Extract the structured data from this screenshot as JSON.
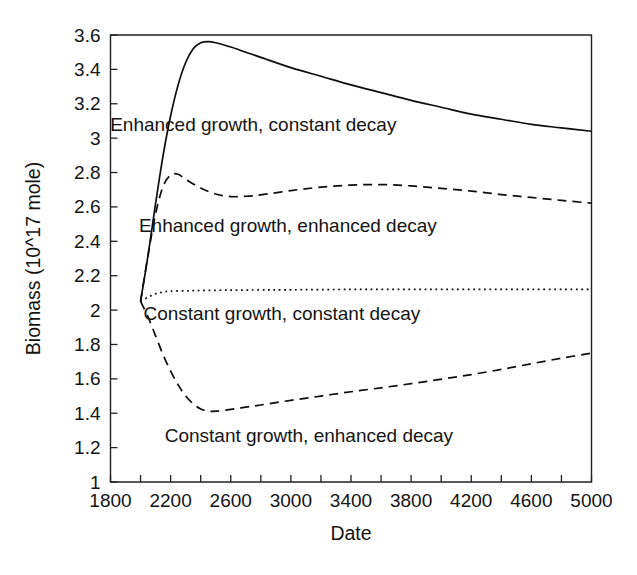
{
  "chart_data": {
    "type": "line",
    "title": "",
    "xlabel": "Date",
    "ylabel": "Biomass (10^17 mole)",
    "xlim": [
      1800,
      5000
    ],
    "ylim": [
      1,
      3.6
    ],
    "grid": false,
    "legend_position": "inline-annotations",
    "x_ticks_labeled": [
      1800,
      2200,
      2600,
      3000,
      3400,
      3800,
      4200,
      4600,
      5000
    ],
    "x_ticks_minor": [
      2000,
      2400,
      2800,
      3200,
      3600,
      4000,
      4400,
      4800
    ],
    "x_tick_labels": [
      "1800",
      "2200",
      "2600",
      "3000",
      "3400",
      "3800",
      "4200",
      "4600",
      "5000"
    ],
    "y_ticks": [
      1,
      1.2,
      1.4,
      1.6,
      1.8,
      2,
      2.2,
      2.4,
      2.6,
      2.8,
      3,
      3.2,
      3.4,
      3.6
    ],
    "y_tick_labels": [
      "1",
      "1.2",
      "1.4",
      "1.6",
      "1.8",
      "2",
      "2.2",
      "2.4",
      "2.6",
      "2.8",
      "3",
      "3.2",
      "3.4",
      "3.6"
    ],
    "series": [
      {
        "name": "Enhanced growth, constant decay",
        "style": "solid",
        "label_x": 2750,
        "label_y": 3.08,
        "x": [
          2000,
          2050,
          2100,
          2150,
          2200,
          2250,
          2300,
          2350,
          2400,
          2450,
          2500,
          2600,
          2700,
          2800,
          3000,
          3200,
          3400,
          3600,
          3800,
          4000,
          4200,
          4400,
          4600,
          4800,
          5000
        ],
        "y": [
          2.05,
          2.32,
          2.62,
          2.9,
          3.13,
          3.31,
          3.44,
          3.52,
          3.555,
          3.562,
          3.555,
          3.53,
          3.5,
          3.47,
          3.41,
          3.36,
          3.31,
          3.265,
          3.22,
          3.18,
          3.14,
          3.11,
          3.08,
          3.06,
          3.04
        ]
      },
      {
        "name": "Enhanced growth, enhanced decay",
        "style": "dashed",
        "label_x": 2980,
        "label_y": 2.49,
        "x": [
          2000,
          2050,
          2100,
          2150,
          2200,
          2250,
          2300,
          2400,
          2500,
          2600,
          2700,
          2800,
          3000,
          3200,
          3400,
          3600,
          3800,
          4000,
          4200,
          4400,
          4600,
          4800,
          5000
        ],
        "y": [
          2.05,
          2.32,
          2.56,
          2.72,
          2.785,
          2.79,
          2.76,
          2.71,
          2.675,
          2.66,
          2.662,
          2.67,
          2.695,
          2.715,
          2.727,
          2.73,
          2.722,
          2.708,
          2.692,
          2.672,
          2.655,
          2.638,
          2.622
        ]
      },
      {
        "name": "Constant growth, constant decay",
        "style": "dotted",
        "label_x": 2940,
        "label_y": 1.98,
        "x": [
          2000,
          2050,
          2100,
          2150,
          2200,
          2300,
          2400,
          2600,
          2800,
          3000,
          3400,
          3800,
          4200,
          4600,
          5000
        ],
        "y": [
          2.05,
          2.075,
          2.095,
          2.105,
          2.11,
          2.112,
          2.114,
          2.116,
          2.117,
          2.118,
          2.12,
          2.12,
          2.12,
          2.12,
          2.12
        ]
      },
      {
        "name": "Constant growth, enhanced decay",
        "style": "dashed",
        "label_x": 3120,
        "label_y": 1.27,
        "x": [
          2000,
          2050,
          2100,
          2150,
          2200,
          2250,
          2300,
          2350,
          2400,
          2450,
          2500,
          2600,
          2700,
          2800,
          3000,
          3200,
          3400,
          3600,
          3800,
          4000,
          4200,
          4400,
          4600,
          4800,
          5000
        ],
        "y": [
          2.05,
          1.96,
          1.85,
          1.74,
          1.645,
          1.565,
          1.5,
          1.455,
          1.425,
          1.412,
          1.412,
          1.422,
          1.435,
          1.448,
          1.475,
          1.5,
          1.525,
          1.548,
          1.572,
          1.598,
          1.625,
          1.655,
          1.688,
          1.72,
          1.75
        ]
      }
    ]
  }
}
